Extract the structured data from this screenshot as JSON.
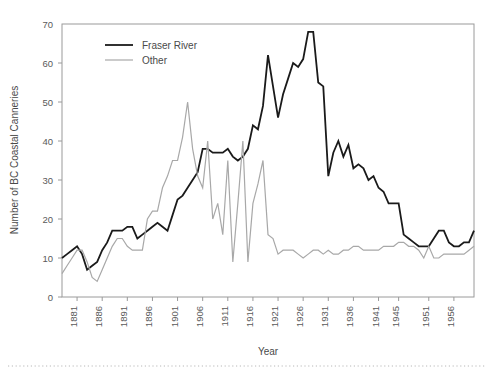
{
  "chart_data": {
    "type": "line",
    "title": "",
    "xlabel": "Year",
    "ylabel": "Number of BC Coastal Canneries",
    "xlim": [
      1878,
      1960
    ],
    "ylim": [
      0,
      70
    ],
    "yticks": [
      0,
      10,
      20,
      30,
      40,
      50,
      60,
      70
    ],
    "xticks": [
      1881,
      1886,
      1891,
      1896,
      1901,
      1906,
      1911,
      1916,
      1921,
      1926,
      1931,
      1936,
      1941,
      1945,
      1951,
      1956
    ],
    "grid": false,
    "legend_position": "top-left",
    "x": [
      1878,
      1879,
      1880,
      1881,
      1882,
      1883,
      1884,
      1885,
      1886,
      1887,
      1888,
      1889,
      1890,
      1891,
      1892,
      1893,
      1894,
      1895,
      1896,
      1897,
      1898,
      1899,
      1900,
      1901,
      1902,
      1903,
      1904,
      1905,
      1906,
      1907,
      1908,
      1909,
      1910,
      1911,
      1912,
      1913,
      1914,
      1915,
      1916,
      1917,
      1918,
      1919,
      1920,
      1921,
      1922,
      1923,
      1924,
      1925,
      1926,
      1927,
      1928,
      1929,
      1930,
      1931,
      1932,
      1933,
      1934,
      1935,
      1936,
      1937,
      1938,
      1939,
      1940,
      1941,
      1942,
      1943,
      1944,
      1945,
      1946,
      1947,
      1948,
      1949,
      1950,
      1951,
      1952,
      1953,
      1954,
      1955,
      1956,
      1957,
      1958,
      1959,
      1960
    ],
    "series": [
      {
        "name": "Fraser River",
        "color": "#1a1a1a",
        "linewidth": 1.8,
        "values": [
          10,
          11,
          12,
          13,
          11,
          7,
          8,
          9,
          12,
          14,
          17,
          17,
          17,
          18,
          18,
          15,
          16,
          17,
          18,
          19,
          18,
          17,
          21,
          25,
          26,
          28,
          30,
          32,
          38,
          38,
          37,
          37,
          37,
          38,
          36,
          35,
          36,
          38,
          44,
          43,
          49,
          62,
          54,
          46,
          52,
          56,
          60,
          59,
          61,
          68,
          68,
          55,
          54,
          31,
          37,
          40,
          36,
          39,
          33,
          34,
          33,
          30,
          31,
          28,
          27,
          24,
          24,
          24,
          16,
          15,
          14,
          13,
          13,
          13,
          15,
          17,
          17,
          14,
          13,
          13,
          14,
          14,
          17
        ]
      },
      {
        "name": "Other",
        "color": "#a8a8a8",
        "linewidth": 1.2,
        "values": [
          6,
          8,
          10,
          12,
          12,
          9,
          5,
          4,
          7,
          10,
          13,
          15,
          15,
          13,
          12,
          12,
          12,
          20,
          22,
          22,
          28,
          31,
          35,
          35,
          41,
          50,
          38,
          31,
          28,
          40,
          20,
          24,
          16,
          35,
          9,
          24,
          40,
          9,
          24,
          29,
          35,
          16,
          15,
          11,
          12,
          12,
          12,
          11,
          10,
          11,
          12,
          12,
          11,
          12,
          11,
          11,
          12,
          12,
          13,
          13,
          12,
          12,
          12,
          12,
          13,
          13,
          13,
          14,
          14,
          13,
          13,
          12,
          10,
          13,
          10,
          10,
          11,
          11,
          11,
          11,
          11,
          12,
          13
        ]
      }
    ]
  },
  "legend": {
    "entries": [
      {
        "label": "Fraser River"
      },
      {
        "label": "Other"
      }
    ]
  },
  "axis": {
    "x_title": "Year",
    "y_title": "Number of BC Coastal Canneries"
  }
}
